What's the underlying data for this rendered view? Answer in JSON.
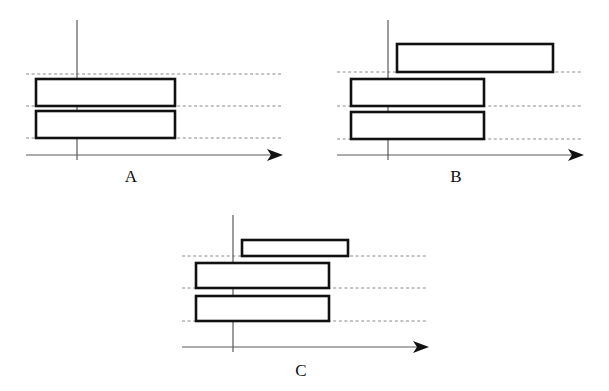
{
  "figure": {
    "type": "line-diagram",
    "background_color": "#ffffff",
    "ink_color": "#111111",
    "gridline_color": "#8a8a8a",
    "axis_color": "#5a5a5a",
    "bar_fill": "#ffffff",
    "bar_stroke": "#111111"
  },
  "panels": [
    {
      "id": "A",
      "label": "A",
      "label_x": 131,
      "label_y": 182,
      "axis": {
        "vertical": {
          "x": 77,
          "y_top": 20,
          "y_bottom": 160
        },
        "horizontal": {
          "y": 155,
          "x_start": 26,
          "x_end": 272
        },
        "arrow": {
          "tip_x": 283,
          "y": 155,
          "half_height": 6,
          "length": 16
        }
      },
      "gridlines": [
        {
          "name": "gridline-top",
          "y": 74,
          "x_start": 26,
          "x_end": 282
        },
        {
          "name": "gridline-middle",
          "y": 106,
          "x_start": 26,
          "x_end": 282
        },
        {
          "name": "gridline-bottom",
          "y": 138,
          "x_start": 26,
          "x_end": 282
        }
      ],
      "bars": [
        {
          "name": "bar-upper",
          "x": 36,
          "y": 79,
          "width": 139,
          "height": 27
        },
        {
          "name": "bar-lower",
          "x": 36,
          "y": 111,
          "width": 139,
          "height": 27
        }
      ]
    },
    {
      "id": "B",
      "label": "B",
      "label_x": 456,
      "label_y": 182,
      "axis": {
        "vertical": {
          "x": 388,
          "y_top": 20,
          "y_bottom": 160
        },
        "horizontal": {
          "y": 155,
          "x_start": 337,
          "x_end": 573
        },
        "arrow": {
          "tip_x": 584,
          "y": 155,
          "half_height": 6,
          "length": 16
        }
      },
      "gridlines": [
        {
          "name": "gridline-top",
          "y": 72,
          "x_start": 337,
          "x_end": 583
        },
        {
          "name": "gridline-middle",
          "y": 106,
          "x_start": 337,
          "x_end": 583
        },
        {
          "name": "gridline-bottom",
          "y": 139,
          "x_start": 337,
          "x_end": 583
        }
      ],
      "bars": [
        {
          "name": "bar-upper",
          "x": 397,
          "y": 44,
          "width": 156,
          "height": 28
        },
        {
          "name": "bar-middle",
          "x": 351,
          "y": 79,
          "width": 133,
          "height": 27
        },
        {
          "name": "bar-lower",
          "x": 351,
          "y": 112,
          "width": 133,
          "height": 27
        }
      ]
    },
    {
      "id": "C",
      "label": "C",
      "label_x": 301,
      "label_y": 376,
      "axis": {
        "vertical": {
          "x": 233,
          "y_top": 215,
          "y_bottom": 352
        },
        "horizontal": {
          "y": 347,
          "x_start": 182,
          "x_end": 418
        },
        "arrow": {
          "tip_x": 429,
          "y": 347,
          "half_height": 6,
          "length": 16
        }
      },
      "gridlines": [
        {
          "name": "gridline-top",
          "y": 256,
          "x_start": 182,
          "x_end": 428
        },
        {
          "name": "gridline-middle",
          "y": 288,
          "x_start": 182,
          "x_end": 428
        },
        {
          "name": "gridline-bottom",
          "y": 321,
          "x_start": 182,
          "x_end": 428
        }
      ],
      "bars": [
        {
          "name": "bar-upper",
          "x": 242,
          "y": 240,
          "width": 106,
          "height": 16
        },
        {
          "name": "bar-middle",
          "x": 196,
          "y": 263,
          "width": 133,
          "height": 25
        },
        {
          "name": "bar-lower",
          "x": 196,
          "y": 296,
          "width": 133,
          "height": 25
        }
      ]
    }
  ]
}
